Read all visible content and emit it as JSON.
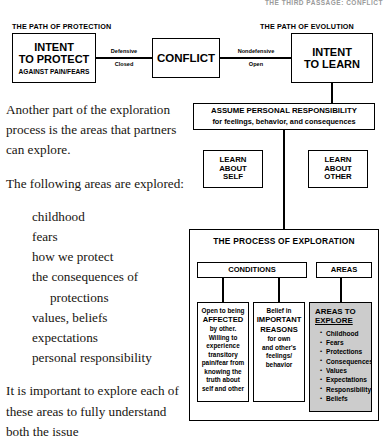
{
  "running_head": "THE THIRD PASSAGE: CONFLICT",
  "body_text": {
    "para1": "Another part of the exploration process is the areas that partners can explore.",
    "para2": "The following areas are explored:",
    "list": [
      "childhood",
      "fears",
      "how we protect",
      "the consequences of",
      "protections",
      "values, beliefs",
      "expectations",
      "personal responsibility"
    ],
    "para3": "It is important to explore each of these areas to fully understand both the issue"
  },
  "diagram": {
    "path_labels": {
      "left": "THE PATH OF PROTECTION",
      "right": "THE PATH OF EVOLUTION"
    },
    "intent_protect": {
      "line1": "INTENT",
      "line2": "TO PROTECT",
      "line3": "AGAINST PAIN/FEARS"
    },
    "conflict": "CONFLICT",
    "intent_learn": {
      "line1": "INTENT",
      "line2": "TO LEARN"
    },
    "connector_left": {
      "top": "Defensive",
      "bottom": "Closed"
    },
    "connector_right": {
      "top": "Nondefensive",
      "bottom": "Open"
    },
    "assume_responsibility": {
      "line1": "ASSUME PERSONAL RESPONSIBILITY",
      "line2": "for feelings, behavior, and consequences"
    },
    "learn_self": "LEARN\nABOUT\nSELF",
    "learn_other": "LEARN\nABOUT\nOTHER",
    "process_title": "THE PROCESS OF EXPLORATION",
    "conditions_label": "CONDITIONS",
    "areas_label": "AREAS",
    "leaf_affected": {
      "pre": "Open to being",
      "emph": "AFFECTED",
      "post": "by other.\nWilling to\nexperience\ntransitory\npain/fear from\nknowing the\ntruth about\nself and other"
    },
    "leaf_reasons": {
      "pre": "Belief in",
      "emph1": "IMPORTANT",
      "emph2": "REASONS",
      "post": "for own\nand other's\nfeelings/\nbehavior"
    },
    "leaf_areas": {
      "title_line1": "AREAS TO",
      "title_line2": "EXPLORE",
      "items": [
        "Childhood",
        "Fears",
        "Protections",
        "Consequences",
        "Values",
        "Expectations",
        "Responsibility",
        "Beliefs"
      ]
    }
  }
}
